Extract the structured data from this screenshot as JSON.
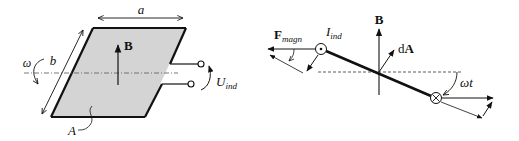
{
  "figure": {
    "left_panel": {
      "labels": {
        "width": "a",
        "height": "b",
        "omega": "ω",
        "field": "B",
        "area": "A",
        "voltage_main": "U",
        "voltage_sub": "ind"
      }
    },
    "right_panel": {
      "labels": {
        "field": "B",
        "area_element": "dA",
        "area_element_d": "d",
        "area_element_A": "A",
        "force_main": "F",
        "force_sub": "magn",
        "current_main": "I",
        "current_sub": "ind",
        "angle": "ωt"
      }
    },
    "colors": {
      "plate_fill": "#d4d4d4",
      "stroke": "#111111",
      "background": "#ffffff"
    }
  }
}
